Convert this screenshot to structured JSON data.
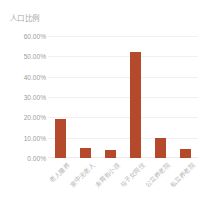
{
  "chart_data": {
    "type": "bar",
    "title": "人口比例",
    "xlabel": "",
    "ylabel": "",
    "categories": [
      "老人赡养",
      "家中无老人",
      "未育有小孩",
      "与子女同住",
      "公立养老院",
      "私立养老院"
    ],
    "values": [
      19.0,
      5.0,
      4.0,
      52.0,
      10.0,
      4.5
    ],
    "ylim": [
      0,
      60
    ],
    "yticks": [
      0,
      10,
      20,
      30,
      40,
      50,
      60
    ],
    "ytick_labels": [
      "0.00%",
      "10.00%",
      "20.00%",
      "30.00%",
      "40.00%",
      "50.00%",
      "60.00%"
    ],
    "grid": true,
    "legend": false,
    "series": [
      {
        "name": "人口比例",
        "values": [
          19.0,
          5.0,
          4.0,
          52.0,
          10.0,
          4.5
        ]
      }
    ]
  },
  "style": {
    "bar_color": "#b4492c",
    "grid_color": "#f2f0ee",
    "tick_text_color": "#9d9d9d",
    "xtick_text_color": "#b9b6b4",
    "title_color": "#a8a8a8",
    "background": "#ffffff"
  }
}
